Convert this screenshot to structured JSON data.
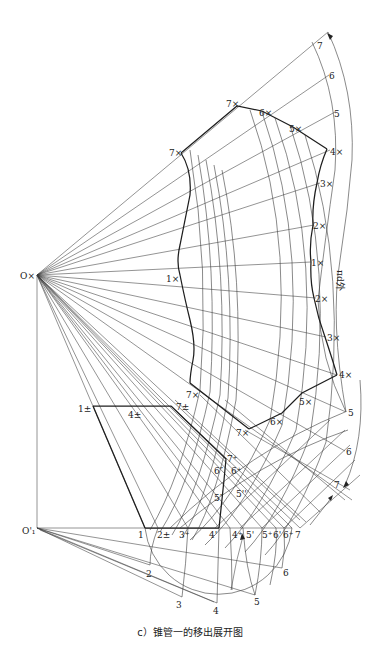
{
  "figure": {
    "caption": "c）锥管一的移出展开图",
    "dimension_label": "πd外",
    "apex_label": "O×",
    "origin_label": "O'₁",
    "colors": {
      "line": "#3a3a3a",
      "bold": "#1e1e1e",
      "background": "#ffffff"
    }
  },
  "labels": {
    "outer_arc_top": [
      "7",
      "6",
      "5"
    ],
    "outer_arc_bottom": [
      "5",
      "6",
      "7"
    ],
    "right_contour": [
      "7×",
      "6×",
      "5×",
      "4×",
      "3×",
      "2×",
      "1×",
      "2×",
      "3×",
      "4×",
      "5×",
      "6×",
      "7×"
    ],
    "left_contour": [
      "7×",
      "1×",
      "7×"
    ],
    "pm_points": [
      "1±",
      "4±",
      "7±"
    ],
    "mid_points": [
      "7⁺",
      "6″",
      "6⁺",
      "5″",
      "5''"
    ],
    "base_line": [
      "1",
      "2±",
      "3⁺",
      "4'",
      "4⁺",
      "5'",
      "5⁺",
      "6'",
      "6⁺",
      "7"
    ],
    "semicircle": [
      "2",
      "3",
      "4",
      "5",
      "6"
    ]
  },
  "points": {
    "apex": [
      37,
      275
    ],
    "origin": [
      37,
      528
    ],
    "base_start": [
      145,
      528
    ],
    "base_end": [
      292,
      528
    ]
  }
}
